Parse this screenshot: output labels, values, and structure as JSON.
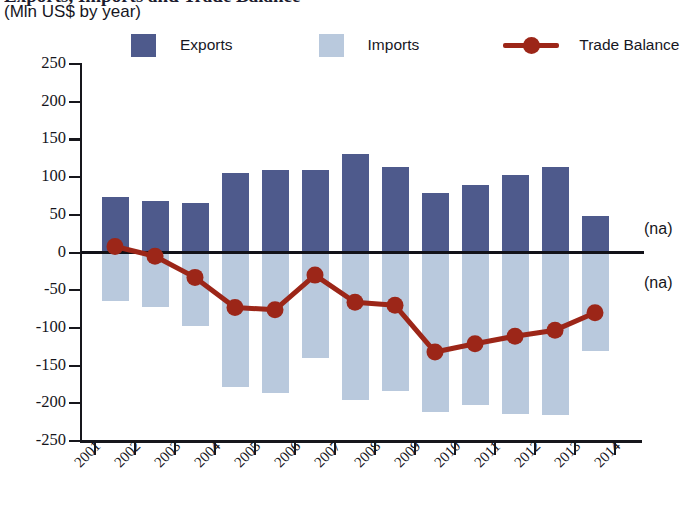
{
  "header": {
    "title_partial": "Exports, Imports and Trade Balance",
    "subtitle": "(Mln US$ by year)"
  },
  "legend": {
    "position": "top",
    "items": [
      {
        "label": "Exports",
        "type": "swatch",
        "color": "#4e5a8c"
      },
      {
        "label": "Imports",
        "type": "swatch",
        "color": "#b9c9dd"
      },
      {
        "label": "Trade Balance",
        "type": "line-marker",
        "color": "#9c2618"
      }
    ]
  },
  "annotations": [
    {
      "name": "na-above-zero",
      "text": "(na)"
    },
    {
      "name": "na-below-zero",
      "text": "(na)"
    }
  ],
  "colors": {
    "exports": "#4e5a8c",
    "imports": "#b9c9dd",
    "trade_balance": "#9c2618",
    "axis": "#17171c",
    "background": "#ffffff"
  },
  "chart_data": {
    "type": "bar",
    "title": "Exports, Imports and Trade Balance",
    "subtitle": "(Mln US$ by year)",
    "xlabel": "",
    "ylabel": "Mln US$",
    "ylim": [
      -250,
      250
    ],
    "ytick_values": [
      250,
      200,
      150,
      100,
      50,
      0,
      -50,
      -100,
      -150,
      -200,
      -250
    ],
    "ytick_labels": [
      "250",
      "200",
      "150",
      "100",
      "50",
      "0",
      "-50",
      "-100",
      "-150",
      "-200",
      "-250"
    ],
    "grid": false,
    "xtick_labels": [
      "2001",
      "2002",
      "2003",
      "2004",
      "2005",
      "2006",
      "2007",
      "2008",
      "2009",
      "2010",
      "2011",
      "2012",
      "2013",
      "2014"
    ],
    "categories": [
      "2001",
      "2002",
      "2003",
      "2004",
      "2005",
      "2006",
      "2007",
      "2008",
      "2009",
      "2010",
      "2011",
      "2012",
      "2013"
    ],
    "series": [
      {
        "name": "Exports",
        "type": "bar",
        "color": "#4e5a8c",
        "values": [
          73,
          68,
          65,
          105,
          110,
          109,
          130,
          113,
          79,
          90,
          103,
          113,
          48
        ]
      },
      {
        "name": "Imports",
        "type": "bar",
        "color": "#b9c9dd",
        "values": [
          -64,
          -72,
          -98,
          -178,
          -186,
          -140,
          -196,
          -184,
          -211,
          -202,
          -214,
          -216,
          -130
        ]
      },
      {
        "name": "Trade Balance",
        "type": "line",
        "color": "#9c2618",
        "values": [
          8,
          -5,
          -33,
          -73,
          -76,
          -30,
          -66,
          -70,
          -132,
          -121,
          -111,
          -103,
          -80
        ]
      }
    ]
  }
}
